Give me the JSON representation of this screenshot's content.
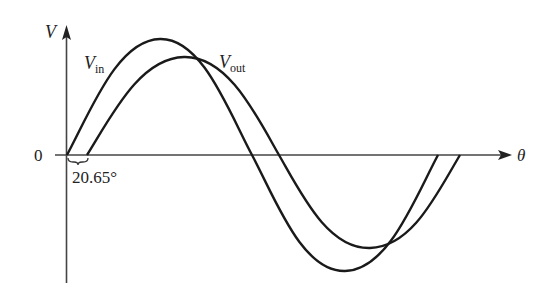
{
  "diagram": {
    "type": "waveform",
    "y_axis_label": "V",
    "x_axis_label": "θ",
    "origin_label": "0",
    "phase_shift_label": "20.65°",
    "series": [
      {
        "name": "V_in",
        "label_main": "V",
        "label_sub": "in",
        "color": "#1a1a1a"
      },
      {
        "name": "V_out",
        "label_main": "V",
        "label_sub": "out",
        "color": "#1a1a1a"
      }
    ]
  }
}
